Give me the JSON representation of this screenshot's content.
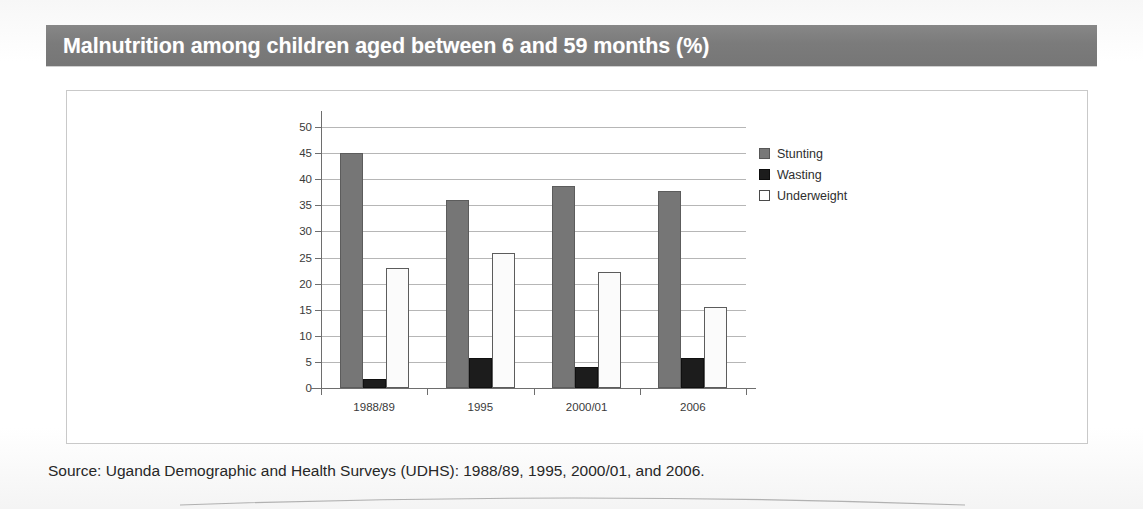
{
  "banner": {
    "title": "Malnutrition among children aged between 6 and 59 months (%)",
    "background_color": "#7b7b7b",
    "text_color": "#ffffff"
  },
  "source": {
    "text": "Source: Uganda Demographic and Health Surveys (UDHS): 1988/89, 1995, 2000/01, and 2006."
  },
  "chart_data": {
    "type": "bar",
    "title": "Malnutrition among children aged between 6 and 59 months (%)",
    "xlabel": "",
    "ylabel": "",
    "ylim": [
      0,
      50
    ],
    "ytick_step": 5,
    "yticks": [
      0,
      5,
      10,
      15,
      20,
      25,
      30,
      35,
      40,
      45,
      50
    ],
    "ytick_labels": [
      "0",
      "5",
      "10",
      "15",
      "20",
      "25",
      "30",
      "35",
      "40",
      "45",
      "50"
    ],
    "grid": true,
    "grid_axis": "y",
    "legend_position": "right",
    "categories": [
      "1988/89",
      "1995",
      "2000/01",
      "2006"
    ],
    "series": [
      {
        "name": "Stunting",
        "color": "#767676",
        "values": [
          45.0,
          36.0,
          38.7,
          37.7
        ]
      },
      {
        "name": "Wasting",
        "color": "#1c1c1c",
        "values": [
          1.8,
          5.8,
          4.0,
          5.8
        ]
      },
      {
        "name": "Underweight",
        "color": "#ffffff",
        "values": [
          23.0,
          25.8,
          22.3,
          15.6
        ]
      }
    ]
  }
}
